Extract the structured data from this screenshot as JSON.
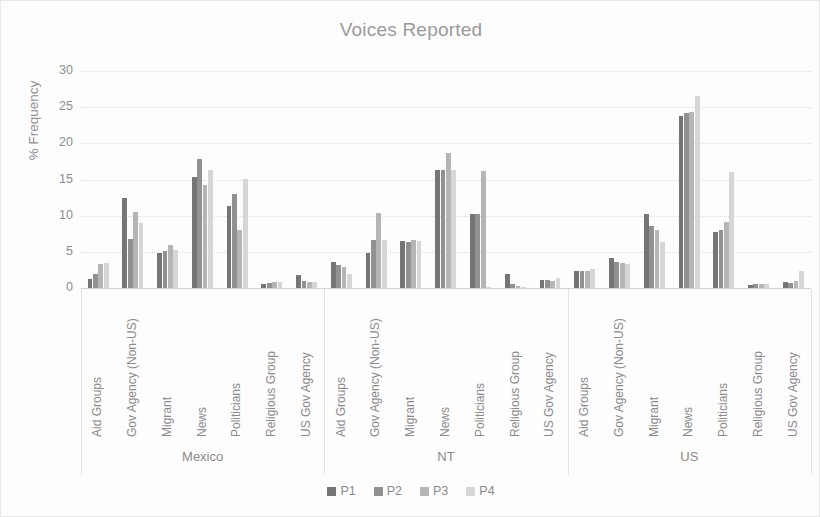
{
  "chart_data": {
    "type": "bar",
    "title": "Voices Reported",
    "xlabel": "",
    "ylabel": "% Frequency",
    "ylim": [
      0,
      30
    ],
    "yticks": [
      0,
      5,
      10,
      15,
      20,
      25,
      30
    ],
    "grid": true,
    "legend_position": "bottom",
    "legend_entries": [
      "P1",
      "P2",
      "P3",
      "P4"
    ],
    "group_labels": [
      "Mexico",
      "NT",
      "US"
    ],
    "categories": [
      "Aid Groups",
      "Gov Agency (Non-US)",
      "Migrant",
      "News",
      "Politicians",
      "Religious Group",
      "US Gov Agency"
    ],
    "series": [
      {
        "name": "P1",
        "color": "#757575",
        "values": {
          "Mexico": [
            1.3,
            12.5,
            4.8,
            15.4,
            11.4,
            0.6,
            1.8
          ],
          "NT": [
            3.6,
            4.9,
            6.5,
            16.3,
            10.2,
            1.9,
            1.1
          ],
          "US": [
            2.4,
            4.2,
            10.3,
            23.8,
            7.8,
            0.4,
            0.8
          ]
        }
      },
      {
        "name": "P2",
        "color": "#919191",
        "values": {
          "Mexico": [
            2.0,
            6.8,
            5.1,
            17.8,
            13.0,
            0.7,
            1.0
          ],
          "NT": [
            3.2,
            6.6,
            6.3,
            16.3,
            10.2,
            0.6,
            1.1
          ],
          "US": [
            2.4,
            3.6,
            8.6,
            24.2,
            8.0,
            0.5,
            0.7
          ]
        }
      },
      {
        "name": "P3",
        "color": "#b5b5b5",
        "values": {
          "Mexico": [
            3.3,
            10.5,
            5.9,
            14.3,
            8.0,
            0.8,
            0.8
          ],
          "NT": [
            2.9,
            10.4,
            6.6,
            18.7,
            16.2,
            0.3,
            1.0
          ],
          "US": [
            2.4,
            3.4,
            8.0,
            24.3,
            9.1,
            0.5,
            1.0
          ]
        }
      },
      {
        "name": "P4",
        "color": "#d6d6d6",
        "values": {
          "Mexico": [
            3.5,
            9.0,
            5.3,
            16.3,
            15.1,
            0.8,
            0.9
          ],
          "NT": [
            2.0,
            6.7,
            6.5,
            16.3,
            0.2,
            0.2,
            1.4
          ],
          "US": [
            2.6,
            3.3,
            6.3,
            26.5,
            16.1,
            0.6,
            2.4
          ]
        }
      }
    ]
  }
}
